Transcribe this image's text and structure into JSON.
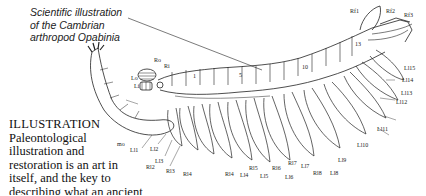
{
  "figure": {
    "caption": [
      "Scientific illustration",
      "of the Cambrian",
      "arthropod Opabinia"
    ],
    "labels": {
      "Rf1": "Rf1",
      "Rf2": "Rf2",
      "Rf3": "Rf3",
      "Ro": "Ro",
      "Ri": "Ri",
      "Lo": "Lo",
      "Li": "Li",
      "seg1": "1",
      "seg5": "5",
      "seg10": "10",
      "seg13": "13",
      "mo": "mo",
      "Ll1": "Ll1",
      "Ll2": "Ll2",
      "Ll3": "Ll3",
      "Ll4": "Ll4",
      "Ll5": "Ll5",
      "Ll6": "Ll6",
      "Ll7": "Ll7",
      "Ll8": "Ll8",
      "Ll9": "Ll9",
      "Ll10": "Ll10",
      "Ll11": "Ll11",
      "Ll12": "Ll12",
      "Ll13": "Ll13",
      "Ll14": "Ll14",
      "Ll15": "Ll15",
      "Rl2": "Rl2",
      "Rl3": "Rl3",
      "Rl4": "Rl4",
      "Rl5": "Rl5",
      "Rl6": "Rl6",
      "Rl7": "Rl7",
      "Rl8": "Rl8"
    }
  },
  "text": {
    "heading": "ILLUSTRATION",
    "lines": [
      "Paleontological",
      "illustration and",
      "restoration is an art in",
      "itself, and the key to",
      "describing what an ancient",
      "animal really looked like. Illustrations are very"
    ]
  }
}
